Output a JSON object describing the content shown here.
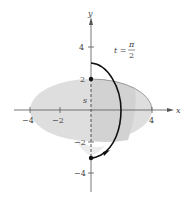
{
  "figure": {
    "type": "parametric-curve-diagram",
    "axes": {
      "x_label": "x",
      "y_label": "y",
      "x_ticks": [
        {
          "value": -4,
          "label": "−4"
        },
        {
          "value": -2,
          "label": "−2"
        },
        {
          "value": 4,
          "label": "4"
        }
      ],
      "y_ticks": [
        {
          "value": 4,
          "label": "4"
        },
        {
          "value": 2,
          "label": "2"
        },
        {
          "value": -2,
          "label": "−2"
        },
        {
          "value": -4,
          "label": "−4"
        }
      ]
    },
    "annotation": {
      "t_label": "t =",
      "numerator": "π",
      "denominator": "2"
    },
    "s_label": "s",
    "shaded_region": "ellipse x-radius 4, y-radius 2 (light gray)",
    "curve": "arc from (0,2.5) through (2.9,0) to (0,−3) with arrow",
    "points": [
      {
        "x": 0,
        "y": 2
      },
      {
        "x": 0,
        "y": -3
      }
    ],
    "colors": {
      "shading": "#dcdcdc",
      "shading_dark": "#cfcfcf",
      "curve": "#111111",
      "axes": "#555555",
      "ellipse_edge": "#888888"
    }
  }
}
